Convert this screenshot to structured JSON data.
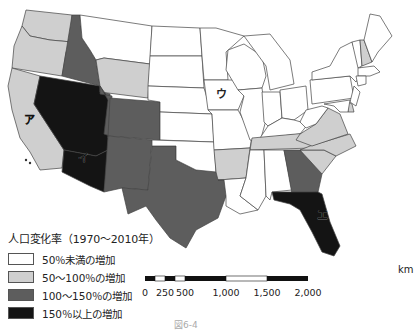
{
  "legend": {
    "title": "人口変化率（1970～2010年）",
    "classes": [
      {
        "key": "c0",
        "label": "50％未満の増加",
        "color": "#ffffff"
      },
      {
        "key": "c1",
        "label": "50～100％の増加",
        "color": "#cfcfcf"
      },
      {
        "key": "c2",
        "label": "100～150％の増加",
        "color": "#5d5d5d"
      },
      {
        "key": "c3",
        "label": "150％以上の増加",
        "color": "#141414"
      }
    ]
  },
  "scale_bar": {
    "unit": "km",
    "ticks": [
      "0",
      "250",
      "500",
      "1,000",
      "1,500",
      "2,000"
    ]
  },
  "map_labels": {
    "a": "ア",
    "i": "イ",
    "u": "ウ",
    "e": "エ"
  },
  "states": {
    "WA": "c1",
    "OR": "c1",
    "CA": "c1",
    "ID": "c2",
    "NV": "c3",
    "AZ": "c3",
    "UT": "c2",
    "CO": "c2",
    "NM": "c2",
    "TX": "c2",
    "WY": "c1",
    "MT": "c0",
    "GA": "c2",
    "FL": "c3",
    "SC": "c1",
    "NC": "c1",
    "VA": "c1",
    "TN": "c1",
    "AR": "c1",
    "NH": "c1",
    "DE": "c1",
    "IA": "c0"
  },
  "caption": "図6-4"
}
